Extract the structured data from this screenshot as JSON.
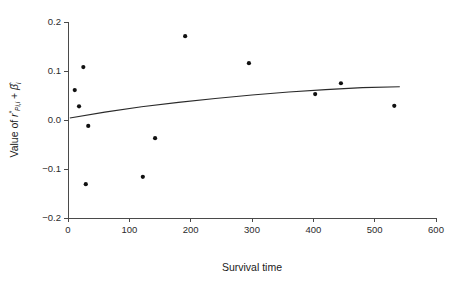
{
  "chart_data": {
    "type": "scatter",
    "title": "",
    "xlabel": "Survival time",
    "ylabel": "Value of r*Pi,i + β̂i",
    "ylabel_parts": {
      "prefix": "Value of",
      "residual_symbol": "r",
      "residual_superscript": "*",
      "residual_subscript": "Pi,i",
      "operator": "+",
      "beta_symbol": "β̂",
      "beta_subscript": "i"
    },
    "xlim": [
      0,
      600
    ],
    "ylim": [
      -0.2,
      0.2
    ],
    "xticks": [
      0,
      100,
      200,
      300,
      400,
      500,
      600
    ],
    "xtick_labels": [
      "0",
      "100",
      "200",
      "300",
      "400",
      "500",
      "600"
    ],
    "yticks": [
      -0.2,
      -0.1,
      0.0,
      0.1,
      0.2
    ],
    "ytick_labels": [
      "-0.2",
      "-0.1",
      "0.0",
      "0.1",
      "0.2"
    ],
    "grid": false,
    "legend": null,
    "points": [
      {
        "x": 11,
        "y": 0.061
      },
      {
        "x": 18,
        "y": 0.028
      },
      {
        "x": 25,
        "y": 0.108
      },
      {
        "x": 33,
        "y": -0.012
      },
      {
        "x": 29,
        "y": -0.131
      },
      {
        "x": 122,
        "y": -0.116
      },
      {
        "x": 142,
        "y": -0.037
      },
      {
        "x": 191,
        "y": 0.171
      },
      {
        "x": 295,
        "y": 0.116
      },
      {
        "x": 403,
        "y": 0.053
      },
      {
        "x": 445,
        "y": 0.075
      },
      {
        "x": 532,
        "y": 0.029
      }
    ],
    "fit_curve": {
      "name": "smoothed fit",
      "x": [
        3,
        60,
        120,
        180,
        240,
        300,
        360,
        420,
        480,
        541
      ],
      "y": [
        0.004,
        0.016,
        0.027,
        0.036,
        0.044,
        0.051,
        0.057,
        0.062,
        0.066,
        0.068
      ]
    },
    "colors": {
      "point": "#111111",
      "curve": "#2a2a2a",
      "axis": "#4a4a4a",
      "background": "#ffffff"
    }
  }
}
